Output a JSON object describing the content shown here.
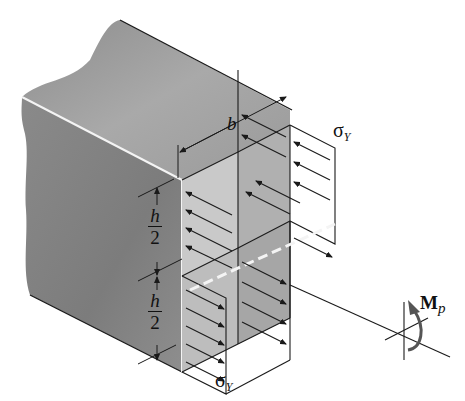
{
  "figure": {
    "type": "isometric beam cross-section, fully plastic stress distribution",
    "colors": {
      "beam_dark": "#7a7a7a",
      "beam_mid": "#9a9a9a",
      "beam_light": "#b6b6b6",
      "stress_light": "#cfcfcf",
      "stress_mid": "#a8a8a8",
      "edge_highlight": "#f4f4f4",
      "line": "#1a1a1a"
    }
  },
  "labels": {
    "width": "b",
    "half_height_top_num": "h",
    "half_height_top_den": "2",
    "half_height_bot_num": "h",
    "half_height_bot_den": "2",
    "stress_top_main": "σ",
    "stress_top_sub": "Y",
    "stress_bottom_main": "σ",
    "stress_bottom_sub": "Y",
    "moment_main": "M",
    "moment_sub": "p"
  }
}
